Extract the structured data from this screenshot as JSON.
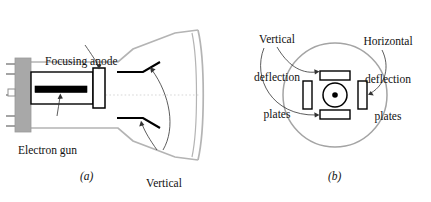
{
  "figure": {
    "type": "cathode-ray-tube-diagram",
    "panels": [
      {
        "id": "a",
        "tag": "(a)",
        "tag_x": 80,
        "tag_y": 170,
        "view": "side cutaway of cathode ray tube",
        "labels": [
          {
            "name": "focusing-anode",
            "text": "Focusing anode",
            "lines": [
              "Focusing anode"
            ],
            "x": 45,
            "y": 30
          },
          {
            "name": "electron-gun",
            "text": "Electron gun",
            "lines": [
              "Electron gun"
            ],
            "x": 18,
            "y": 119
          },
          {
            "name": "vertical-deflection-plates",
            "text": "Vertical deflection plates",
            "lines": [
              "Vertical",
              "deflection",
              "plates"
            ],
            "x": 133,
            "y": 152
          }
        ]
      },
      {
        "id": "b",
        "tag": "(b)",
        "tag_x": 328,
        "tag_y": 170,
        "view": "end-on cross section through deflection plates",
        "labels": [
          {
            "name": "vertical-deflection-plates",
            "text": "Vertical deflection plates",
            "lines": [
              "Vertical",
              "deflection",
              "plates"
            ],
            "x": 246,
            "y": 8
          },
          {
            "name": "horizontal-deflection-plates",
            "text": "Horizontal deflection plates",
            "lines": [
              "Horizontal",
              "deflection",
              "plates"
            ],
            "x": 352,
            "y": 10
          }
        ]
      }
    ],
    "parts": {
      "tube_envelope": "glass envelope",
      "screen": "phosphor screen face",
      "axis": "beam axis",
      "base_pins": "socket pins",
      "gun_body": "electron gun body",
      "cathode_bar": "cathode / heater bar",
      "anode_ring": "focusing anode ring",
      "upper_plate": "upper vertical deflection plate",
      "lower_plate": "lower vertical deflection plate",
      "beam_dot": "electron beam (out of page)",
      "plate_top": "top plate",
      "plate_bottom": "bottom plate",
      "plate_left": "left plate",
      "plate_right": "right plate"
    },
    "colors": {
      "envelope": "#b4b4b4",
      "ink": "#000000",
      "base_fill": "#a8a8a8",
      "leader": "#4d4d4d",
      "axis": "#cfcfcf",
      "background": "#ffffff",
      "text": "#111111"
    }
  }
}
